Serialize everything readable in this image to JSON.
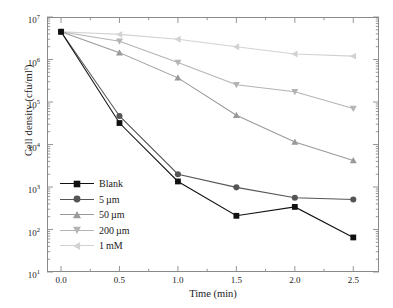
{
  "chart_data": {
    "type": "line",
    "title": "",
    "xlabel": "Time (min)",
    "ylabel": "Cell density (cfu/ml)",
    "ylabel_sup": "l",
    "x": [
      0.0,
      0.5,
      1.0,
      1.5,
      2.0,
      2.5
    ],
    "xlim": [
      -0.12,
      2.72
    ],
    "ylim": [
      10,
      10000000
    ],
    "yscale": "log",
    "xtick_labels": [
      "0.0",
      "0.5",
      "1.0",
      "1.5",
      "2.0",
      "2.5"
    ],
    "xticks": [
      0.0,
      0.5,
      1.0,
      1.5,
      2.0,
      2.5
    ],
    "ytick_labels": [
      "10",
      "10",
      "10",
      "10",
      "10",
      "10",
      "10"
    ],
    "ytick_exponents": [
      "1",
      "2",
      "3",
      "4",
      "5",
      "6",
      "7"
    ],
    "yticks": [
      10,
      100,
      1000,
      10000,
      100000,
      1000000,
      10000000
    ],
    "grid": false,
    "legend_position": "lower left",
    "series": [
      {
        "name": "Blank",
        "marker": "square",
        "color": "#111111",
        "values": [
          4500000,
          32000,
          1350,
          210,
          340,
          65
        ]
      },
      {
        "name": "5 µm",
        "marker": "circle",
        "color": "#555555",
        "values": [
          4500000,
          47000,
          2000,
          980,
          560,
          510
        ]
      },
      {
        "name": "50 µm",
        "marker": "triangle-up",
        "color": "#9a9a9a",
        "values": [
          4500000,
          1450000,
          370000,
          49000,
          11500,
          4200
        ]
      },
      {
        "name": "200 µm",
        "marker": "triangle-down",
        "color": "#b4b4b4",
        "values": [
          4500000,
          2700000,
          850000,
          255000,
          175000,
          70000
        ]
      },
      {
        "name": "1 mM",
        "marker": "triangle-left",
        "color": "#d2d2d2",
        "values": [
          4500000,
          3900000,
          3000000,
          2000000,
          1350000,
          1200000
        ]
      }
    ]
  },
  "axis": {
    "frame_color": "#8a8a8a"
  }
}
